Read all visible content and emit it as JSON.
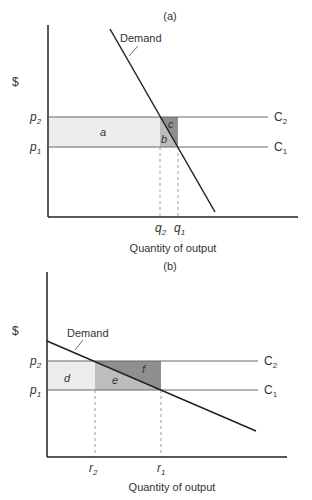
{
  "panel_a": {
    "title": "(a)",
    "y_axis_label": "$",
    "x_axis_label": "Quantity of output",
    "curve_label": "Demand",
    "price_labels": {
      "p2": "p",
      "p2_sub": "2",
      "p1": "p",
      "p1_sub": "1"
    },
    "cost_labels": {
      "c2": "C",
      "c2_sub": "2",
      "c1": "C",
      "c1_sub": "1"
    },
    "quantity_labels": {
      "q2": "q",
      "q2_sub": "2",
      "q1": "q",
      "q1_sub": "1"
    },
    "region_labels": {
      "a": "a",
      "b": "b",
      "c": "c"
    }
  },
  "panel_b": {
    "title": "(b)",
    "y_axis_label": "$",
    "x_axis_label": "Quantity of output",
    "curve_label": "Demand",
    "price_labels": {
      "p2": "p",
      "p2_sub": "2",
      "p1": "p",
      "p1_sub": "1"
    },
    "cost_labels": {
      "c2": "C",
      "c2_sub": "2",
      "c1": "C",
      "c1_sub": "1"
    },
    "quantity_labels": {
      "r2": "r",
      "r2_sub": "2",
      "r1": "r",
      "r1_sub": "1"
    },
    "region_labels": {
      "d": "d",
      "e": "e",
      "f": "f"
    }
  },
  "colors": {
    "light_region": "#ededed",
    "mid_region": "#bdbdbd",
    "dark_region": "#8f8f8f",
    "line": "#222222",
    "cost_line": "#666666"
  }
}
